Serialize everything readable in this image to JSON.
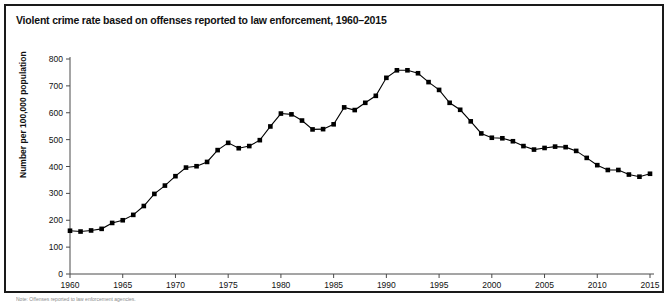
{
  "figure": {
    "title": "Violent crime rate based on offenses reported to law enforcement, 1960–2015",
    "note": "Note: Offenses reported to law enforcement agencies.",
    "border_color": "#1a1a1a",
    "marker_color": "#000000"
  },
  "chart_data": {
    "type": "line",
    "title": "Violent crime rate based on offenses reported to law enforcement, 1960–2015",
    "xlabel": "",
    "ylabel": "Number per 100,000 population",
    "xlim": [
      1960,
      2015
    ],
    "ylim": [
      0,
      800
    ],
    "ytick_step": 100,
    "xtick_step": 5,
    "grid": false,
    "legend": "none",
    "marker": "square",
    "ytick_labels": [
      "0",
      "100",
      "200",
      "300",
      "400",
      "500",
      "600",
      "700",
      "800"
    ],
    "xtick_labels": [
      "1960",
      "1965",
      "1970",
      "1975",
      "1980",
      "1985",
      "1990",
      "1995",
      "2000",
      "2005",
      "2010",
      "2015"
    ],
    "x": [
      1960,
      1961,
      1962,
      1963,
      1964,
      1965,
      1966,
      1967,
      1968,
      1969,
      1970,
      1971,
      1972,
      1973,
      1974,
      1975,
      1976,
      1977,
      1978,
      1979,
      1980,
      1981,
      1982,
      1983,
      1984,
      1985,
      1986,
      1987,
      1988,
      1989,
      1990,
      1991,
      1992,
      1993,
      1994,
      1995,
      1996,
      1997,
      1998,
      1999,
      2000,
      2001,
      2002,
      2003,
      2004,
      2005,
      2006,
      2007,
      2008,
      2009,
      2010,
      2011,
      2012,
      2013,
      2014,
      2015
    ],
    "series": [
      {
        "name": "Violent crime rate",
        "values": [
          161,
          158,
          162,
          168,
          190,
          200,
          220,
          253,
          298,
          329,
          364,
          396,
          401,
          417,
          461,
          488,
          468,
          476,
          498,
          549,
          597,
          594,
          571,
          538,
          539,
          557,
          620,
          610,
          637,
          663,
          730,
          758,
          758,
          747,
          714,
          685,
          637,
          611,
          568,
          523,
          507,
          505,
          494,
          476,
          463,
          469,
          474,
          472,
          458,
          432,
          405,
          387,
          387,
          370,
          362,
          373
        ]
      }
    ]
  }
}
